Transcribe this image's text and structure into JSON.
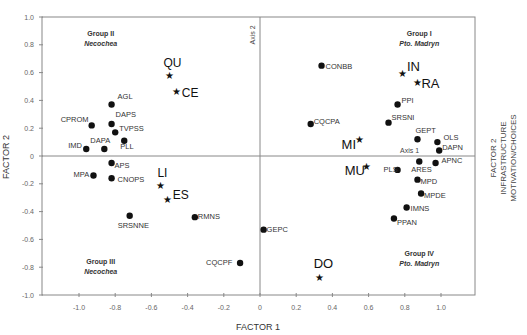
{
  "chart_data": {
    "type": "scatter",
    "title": "",
    "xlabel": "FACTOR 1",
    "ylabel": "FACTOR 2",
    "right_label_lines": [
      "FACTOR 2",
      "INFRASTRUCTURE",
      "MOTIVATION/CHOICES"
    ],
    "axis1_label": "Axis 1",
    "axis2_label": "Axis 2",
    "xlim": [
      -1.2,
      1.2
    ],
    "ylim": [
      -1.0,
      1.0
    ],
    "x_ticks": [
      "-1.0",
      "-0.8",
      "-0.6",
      "-0.4",
      "-0.2",
      "0",
      "0.2",
      "0.4",
      "0.6",
      "0.8",
      "1.0"
    ],
    "x_tick_values": [
      -1.0,
      -0.8,
      -0.6,
      -0.4,
      -0.2,
      0,
      0.2,
      0.4,
      0.6,
      0.8,
      1.0
    ],
    "y_ticks": [
      "1.0",
      "0.8",
      "0.6",
      "0.4",
      "0.2",
      "0",
      "-0.2",
      "-0.4",
      "-0.6",
      "-0.8",
      "-1.0"
    ],
    "y_tick_values": [
      1.0,
      0.8,
      0.6,
      0.4,
      0.2,
      0,
      -0.2,
      -0.4,
      -0.6,
      -0.8,
      -1.0
    ],
    "grid": false,
    "groups": [
      {
        "name": "Group I",
        "place": "Pto. Madryn",
        "x": 0.88,
        "y": 0.86
      },
      {
        "name": "Group II",
        "place": "Necochea",
        "x": -0.88,
        "y": 0.86
      },
      {
        "name": "Group III",
        "place": "Necochea",
        "x": -0.88,
        "y": -0.78
      },
      {
        "name": "Group IV",
        "place": "Pto. Madryn",
        "x": 0.88,
        "y": -0.72
      }
    ],
    "series": [
      {
        "name": "variables",
        "marker": "circle",
        "points": [
          {
            "label": "CONBB",
            "x": 0.34,
            "y": 0.65
          },
          {
            "label": "PPI",
            "x": 0.76,
            "y": 0.37
          },
          {
            "label": "CQCPA",
            "x": 0.28,
            "y": 0.23
          },
          {
            "label": "SRSNI",
            "x": 0.71,
            "y": 0.24
          },
          {
            "label": "GEPT",
            "x": 0.87,
            "y": 0.12
          },
          {
            "label": "OLS",
            "x": 0.98,
            "y": 0.1
          },
          {
            "label": "DAPN",
            "x": 0.99,
            "y": 0.04
          },
          {
            "label": "PLS",
            "x": 0.76,
            "y": -0.1
          },
          {
            "label": "ARES",
            "x": 0.88,
            "y": -0.04
          },
          {
            "label": "APNC",
            "x": 0.97,
            "y": -0.05
          },
          {
            "label": "MPD",
            "x": 0.87,
            "y": -0.17
          },
          {
            "label": "MPDE",
            "x": 0.89,
            "y": -0.27
          },
          {
            "label": "IMNS",
            "x": 0.81,
            "y": -0.37
          },
          {
            "label": "PPAN",
            "x": 0.74,
            "y": -0.45
          },
          {
            "label": "GEPC",
            "x": 0.02,
            "y": -0.53
          },
          {
            "label": "AGL",
            "x": -0.82,
            "y": 0.37
          },
          {
            "label": "CPROM",
            "x": -0.93,
            "y": 0.22
          },
          {
            "label": "DAPS",
            "x": -0.82,
            "y": 0.23
          },
          {
            "label": "TVPSS",
            "x": -0.8,
            "y": 0.17
          },
          {
            "label": "PLL",
            "x": -0.75,
            "y": 0.11
          },
          {
            "label": "DAPA",
            "x": -0.86,
            "y": 0.05
          },
          {
            "label": "IMD",
            "x": -0.96,
            "y": 0.05
          },
          {
            "label": "APS",
            "x": -0.82,
            "y": -0.05
          },
          {
            "label": "MPA",
            "x": -0.92,
            "y": -0.14
          },
          {
            "label": "CNOPS",
            "x": -0.82,
            "y": -0.16
          },
          {
            "label": "SRSNNE",
            "x": -0.72,
            "y": -0.43
          },
          {
            "label": "RMNS",
            "x": -0.36,
            "y": -0.44
          },
          {
            "label": "CQCPF",
            "x": -0.11,
            "y": -0.77
          }
        ]
      },
      {
        "name": "cases",
        "marker": "star",
        "points": [
          {
            "label": "IN",
            "x": 0.79,
            "y": 0.6
          },
          {
            "label": "RA",
            "x": 0.87,
            "y": 0.53
          },
          {
            "label": "MI",
            "x": 0.55,
            "y": 0.12
          },
          {
            "label": "MU",
            "x": 0.59,
            "y": -0.07
          },
          {
            "label": "DO",
            "x": 0.33,
            "y": -0.87
          },
          {
            "label": "QU",
            "x": -0.5,
            "y": 0.58
          },
          {
            "label": "CE",
            "x": -0.46,
            "y": 0.47
          },
          {
            "label": "LI",
            "x": -0.55,
            "y": -0.21
          },
          {
            "label": "ES",
            "x": -0.51,
            "y": -0.31
          }
        ]
      }
    ]
  }
}
